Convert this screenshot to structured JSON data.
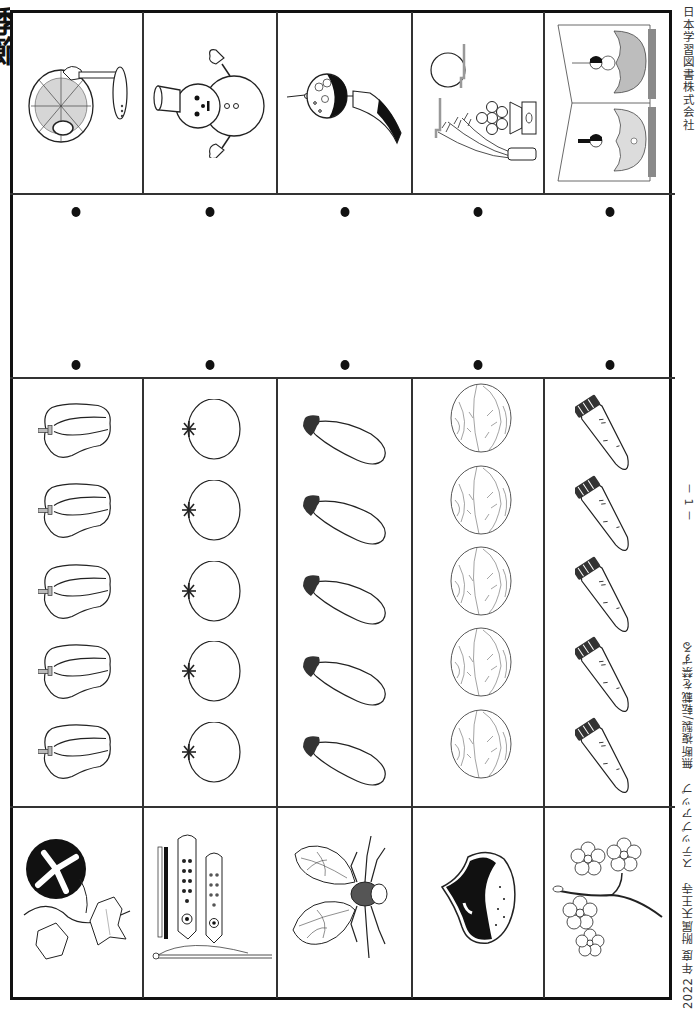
{
  "page": {
    "title_fragment": "季節",
    "publisher": "日本学習図書株式会社",
    "page_number": "－ 1 －",
    "footer": "2022 年度 附属天王寺　ステップアップ　無断複製/転載を禁ずる"
  },
  "grid": {
    "columns": 5,
    "top_row": {
      "label": "seasonal items",
      "items": [
        {
          "name": "electric-fan",
          "season": "summer"
        },
        {
          "name": "snowman",
          "season": "winter"
        },
        {
          "name": "wind-chime",
          "season": "summer"
        },
        {
          "name": "moon-viewing",
          "season": "autumn"
        },
        {
          "name": "hina-dolls",
          "season": "spring"
        }
      ]
    },
    "connect_dots": {
      "top_row_count": 5,
      "bottom_row_count": 5
    },
    "vegetable_columns": [
      {
        "name": "green-pepper",
        "count": 5
      },
      {
        "name": "tomato",
        "count": 5
      },
      {
        "name": "eggplant",
        "count": 5
      },
      {
        "name": "cabbage",
        "count": 5
      },
      {
        "name": "carrot",
        "count": 5
      }
    ],
    "bottom_row": {
      "items": [
        {
          "name": "morning-glory",
          "season": "summer"
        },
        {
          "name": "koinobori",
          "season": "spring"
        },
        {
          "name": "cicada",
          "season": "summer"
        },
        {
          "name": "chestnut",
          "season": "autumn"
        },
        {
          "name": "cherry-blossom",
          "season": "spring"
        }
      ]
    }
  },
  "colors": {
    "line": "#333333",
    "ink": "#111111",
    "hina_gray": "#bdbdbd",
    "hina_dark": "#8a8a8a"
  }
}
